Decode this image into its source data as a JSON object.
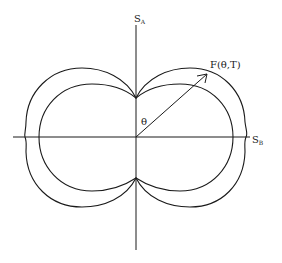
{
  "diagram": {
    "type": "polar-plot",
    "axes": {
      "vertical_label": "S",
      "vertical_subscript": "A",
      "horizontal_label": "S",
      "horizontal_subscript": "B"
    },
    "vector_label": "F(θ,T)",
    "angle_label": "θ",
    "curves": [
      {
        "name": "outer-curve",
        "shape": "peanut/figure-eight lobe pair"
      },
      {
        "name": "inner-curve",
        "shape": "peanut/figure-eight lobe pair"
      }
    ],
    "colors": {
      "line": "#1a1a1a",
      "background": "#ffffff"
    }
  }
}
